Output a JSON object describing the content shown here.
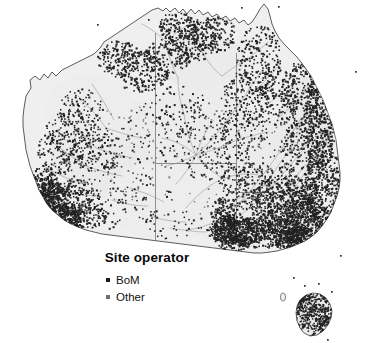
{
  "figure": {
    "kind": "dot-density-map",
    "region": "Australia",
    "background_color": "#ffffff",
    "land_fill": "#efefef",
    "coast_color": "#4a4a4a",
    "state_border_color": "#8a8a8a",
    "river_color": "#9a9a9a",
    "dot_color": "#222222"
  },
  "legend": {
    "title": "Site operator",
    "entries": [
      {
        "label": "BoM",
        "swatch_color": "#1a1a1a"
      },
      {
        "label": "Other",
        "swatch_color": "#6e6e6e"
      }
    ]
  },
  "chart_data": {
    "type": "scatter",
    "title": "Site operator",
    "xlabel": "",
    "ylabel": "",
    "legend_position": "inset-bottom-left",
    "grid": false,
    "series": [
      {
        "name": "BoM",
        "marker": "square",
        "color": "#1a1a1a"
      },
      {
        "name": "Other",
        "marker": "square",
        "color": "#6e6e6e"
      }
    ]
  }
}
